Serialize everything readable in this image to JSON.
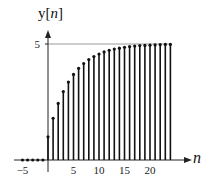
{
  "chart_data": {
    "type": "stem",
    "title": "",
    "ylabel": "y[n]",
    "ylabel_main": "y[",
    "ylabel_var": "n",
    "ylabel_close": "]",
    "xlabel": "n",
    "x_ticks": [
      -5,
      5,
      10,
      15,
      20
    ],
    "x_tick_labels": [
      "−5",
      "5",
      "10",
      "15",
      "20"
    ],
    "y_ticks": [
      5
    ],
    "y_tick_labels": [
      "5"
    ],
    "asymptote": 5,
    "xlim": [
      -6,
      28
    ],
    "ylim": [
      0,
      5.6
    ],
    "grid": false,
    "legend": null,
    "n": [
      -5,
      -4,
      -3,
      -2,
      -1,
      0,
      1,
      2,
      3,
      4,
      5,
      6,
      7,
      8,
      9,
      10,
      11,
      12,
      13,
      14,
      15,
      16,
      17,
      18,
      19,
      20,
      21,
      22,
      23,
      24
    ],
    "values": [
      0,
      0,
      0,
      0,
      0,
      1.0,
      1.8,
      2.44,
      2.95,
      3.36,
      3.69,
      3.95,
      4.16,
      4.33,
      4.46,
      4.57,
      4.66,
      4.73,
      4.78,
      4.82,
      4.86,
      4.89,
      4.91,
      4.93,
      4.94,
      4.95,
      4.96,
      4.97,
      4.98,
      4.98
    ]
  }
}
